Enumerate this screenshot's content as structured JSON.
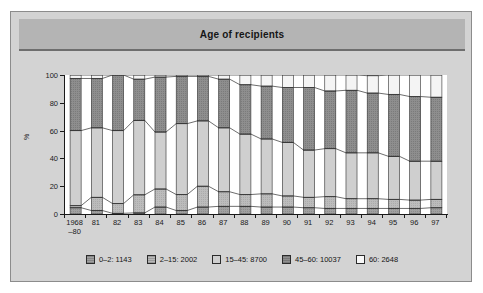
{
  "figure": {
    "title": "Age of recipients",
    "background_color": "#d3d3d3",
    "title_band_color": "#b4b4b4",
    "plot_background_color": "#ffffff"
  },
  "chart_data": {
    "type": "bar",
    "stacked": true,
    "normalized_percent": true,
    "title": "Age of recipients",
    "xlabel": "",
    "ylabel": "%",
    "ylim": [
      0,
      100
    ],
    "yticks": [
      0,
      20,
      40,
      60,
      80,
      100
    ],
    "grid": false,
    "legend_position": "bottom",
    "categories": [
      "1968–80",
      "81",
      "82",
      "83",
      "84",
      "85",
      "86",
      "87",
      "88",
      "89",
      "90",
      "91",
      "92",
      "93",
      "94",
      "95",
      "96",
      "97"
    ],
    "series": [
      {
        "name": "0–2: 1143",
        "label": "0–2",
        "total": 1143,
        "color": "#a0a0a0",
        "pattern": "fine-hatch",
        "values": [
          4.5,
          2.5,
          0.5,
          0.8,
          5.0,
          2.5,
          5.0,
          5.5,
          5.5,
          5.0,
          5.0,
          4.5,
          4.0,
          4.0,
          4.0,
          4.0,
          4.0,
          4.5
        ]
      },
      {
        "name": "2–15: 2002",
        "label": "2–15",
        "total": 2002,
        "color": "#b8b8b8",
        "pattern": "fine-hatch",
        "values": [
          1.5,
          9.5,
          7.0,
          13.0,
          13.0,
          11.5,
          15.0,
          10.5,
          8.5,
          9.5,
          8.0,
          7.5,
          8.5,
          7.0,
          7.0,
          6.5,
          6.0,
          6.0
        ]
      },
      {
        "name": "15–45: 8700",
        "label": "15–45",
        "total": 8700,
        "color": "#cfcfcf",
        "pattern": "solid",
        "values": [
          54.0,
          50.0,
          52.5,
          53.5,
          41.0,
          51.0,
          47.0,
          46.0,
          43.5,
          39.5,
          38.5,
          34.0,
          34.5,
          33.0,
          33.0,
          31.0,
          28.0,
          27.5
        ]
      },
      {
        "name": "45–60: 10037",
        "label": "45–60",
        "total": 10037,
        "color": "#8e8e8e",
        "pattern": "fine-hatch",
        "values": [
          37.5,
          35.5,
          40.0,
          29.7,
          39.5,
          34.0,
          32.0,
          35.0,
          35.5,
          38.0,
          39.5,
          45.0,
          41.5,
          45.0,
          43.0,
          44.5,
          46.5,
          46.0
        ]
      },
      {
        "name": "60: 2648",
        "label": "60",
        "total": 2648,
        "color": "#f2f2f2",
        "pattern": "solid",
        "values": [
          2.5,
          2.5,
          0.0,
          3.0,
          1.5,
          1.0,
          1.0,
          3.0,
          7.0,
          8.0,
          9.0,
          9.0,
          11.5,
          11.0,
          12.5,
          14.0,
          15.5,
          16.0
        ]
      }
    ]
  },
  "legend": [
    {
      "label": "0–2: 1143",
      "color": "#a0a0a0"
    },
    {
      "label": "2–15: 2002",
      "color": "#b8b8b8"
    },
    {
      "label": "15–45: 8700",
      "color": "#cfcfcf"
    },
    {
      "label": "45–60: 10037",
      "color": "#8e8e8e"
    },
    {
      "label": "60: 2648",
      "color": "#f8f8f8"
    }
  ]
}
